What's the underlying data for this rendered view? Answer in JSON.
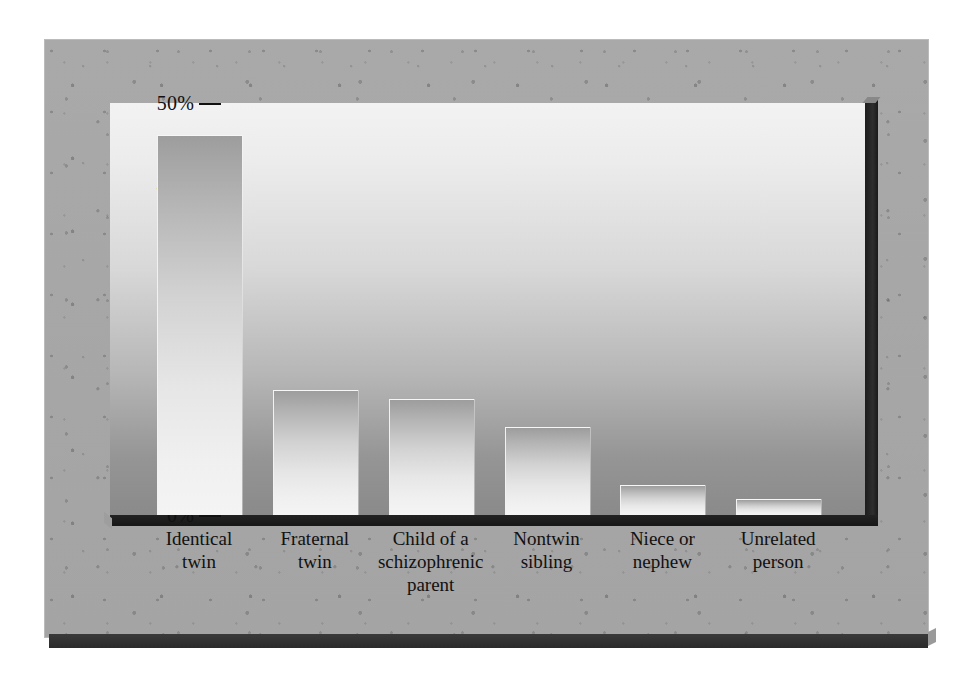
{
  "figure": {
    "background_color": "#a7a7a7",
    "plot_top_color": "#f2f2f2",
    "plot_bottom_color": "#8a8a8a",
    "bar_color_top": "#9d9d9d",
    "bar_color_bottom": "#f4f4f4",
    "axis_color": "#111111"
  },
  "chart_data": {
    "type": "bar",
    "title": "",
    "xlabel": "",
    "ylabel": "",
    "ylim": [
      0,
      50
    ],
    "y_unit": "%",
    "grid": false,
    "legend": null,
    "y_ticks_major": [
      "0%",
      "10%",
      "20%",
      "30%",
      "40%",
      "50%"
    ],
    "y_ticks_major_values": [
      0,
      10,
      20,
      30,
      40,
      50
    ],
    "y_ticks_minor_values": [
      5,
      15,
      25,
      35,
      45
    ],
    "categories": [
      "Identical twin",
      "Fraternal twin",
      "Child of a schizophrenic parent",
      "Nontwin sibling",
      "Niece or nephew",
      "Unrelated person"
    ],
    "category_lines": [
      [
        "Identical",
        "twin"
      ],
      [
        "Fraternal",
        "twin"
      ],
      [
        "Child of a",
        "schizophrenic",
        "parent"
      ],
      [
        "Nontwin",
        "sibling"
      ],
      [
        "Niece or",
        "nephew"
      ],
      [
        "Unrelated",
        "person"
      ]
    ],
    "values": [
      46,
      15,
      14,
      10.5,
      3.5,
      1.8
    ]
  }
}
